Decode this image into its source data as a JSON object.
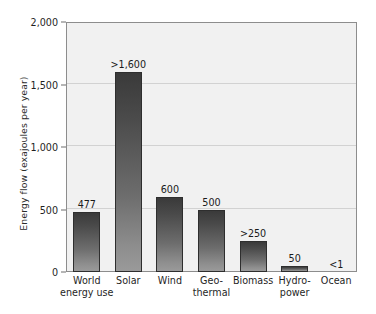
{
  "chart_data": {
    "type": "bar",
    "title": "",
    "subtitle": "",
    "xlabel": "",
    "ylabel": "Energy flow (exajoules per year)",
    "ylim": [
      0,
      2000
    ],
    "yticks": [
      "0",
      "500",
      "1,000",
      "1,500",
      "2,000"
    ],
    "ytick_values": [
      0,
      500,
      1000,
      1500,
      2000
    ],
    "grid": true,
    "legend": null,
    "legend_position": "none",
    "categories": [
      "World energy use",
      "Solar",
      "Wind",
      "Geo-thermal",
      "Biomass",
      "Hydro-power",
      "Ocean"
    ],
    "category_lines": [
      [
        "World",
        "energy use"
      ],
      [
        "Solar",
        ""
      ],
      [
        "Wind",
        ""
      ],
      [
        "Geo-",
        "thermal"
      ],
      [
        "Biomass",
        ""
      ],
      [
        "Hydro-",
        "power"
      ],
      [
        "Ocean",
        ""
      ]
    ],
    "values": [
      477,
      1600,
      600,
      500,
      250,
      50,
      1
    ],
    "data_labels": [
      "477",
      ">1,600",
      "600",
      "500",
      ">250",
      "50",
      "<1"
    ]
  },
  "style": {
    "bar_top_color": "#3a3a3a",
    "bar_bottom_color": "#9a9a9a",
    "plot_background": "#f1f1f1",
    "page_background": "#ffffff",
    "gridline_color": "#d2d2d2",
    "axis_color": "#8d8d8d",
    "text_color": "#1f1f1f"
  }
}
